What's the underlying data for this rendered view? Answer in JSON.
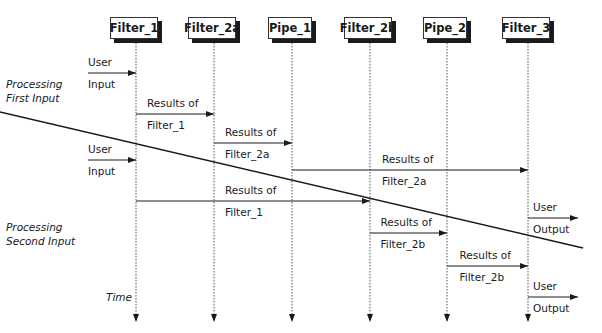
{
  "diagram": {
    "components": [
      {
        "label": "Filter_1",
        "x": 136
      },
      {
        "label": "Filter_2a",
        "x": 214
      },
      {
        "label": "Pipe_1",
        "x": 292
      },
      {
        "label": "Filter_2b",
        "x": 370
      },
      {
        "label": "Pipe_2",
        "x": 447
      },
      {
        "label": "Filter_3",
        "x": 528
      }
    ],
    "side_labels": {
      "first": [
        "Processing",
        "First Input"
      ],
      "second": [
        "Processing",
        "Second Input"
      ],
      "time": "Time"
    },
    "messages": [
      {
        "top": "User",
        "bottom": "Input",
        "from_x": 88,
        "to_x": 136,
        "y": 73
      },
      {
        "top": "Results of",
        "bottom": "Filter_1",
        "from_x": 136,
        "to_x": 214,
        "y": 114
      },
      {
        "top": "Results of",
        "bottom": "Filter_2a",
        "from_x": 214,
        "to_x": 292,
        "y": 143
      },
      {
        "top": "User",
        "bottom": "Input",
        "from_x": 88,
        "to_x": 136,
        "y": 160
      },
      {
        "top": "Results of",
        "bottom": "Filter_2a",
        "from_x": 292,
        "to_x": 528,
        "y": 170
      },
      {
        "top": "Results of",
        "bottom": "Filter_1",
        "from_x": 136,
        "to_x": 370,
        "y": 201
      },
      {
        "top": "User",
        "bottom": "Output",
        "from_x": 528,
        "to_x": 578,
        "y": 218
      },
      {
        "top": "Results of",
        "bottom": "Filter_2b",
        "from_x": 370,
        "to_x": 447,
        "y": 233
      },
      {
        "top": "Results of",
        "bottom": "Filter_2b",
        "from_x": 447,
        "to_x": 528,
        "y": 266
      },
      {
        "top": "User",
        "bottom": "Output",
        "from_x": 528,
        "to_x": 578,
        "y": 297
      }
    ],
    "divider": {
      "x1": 0,
      "y1": 112,
      "x2": 583,
      "y2": 248
    }
  }
}
